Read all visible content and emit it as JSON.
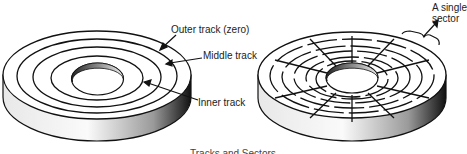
{
  "figure": {
    "caption": "Tracks and Sectors",
    "left_disk": {
      "title": "tracks-diagram",
      "labels": {
        "outer": "Outer track (zero)",
        "middle": "Middle track",
        "inner": "Inner track"
      },
      "track_count": 4
    },
    "right_disk": {
      "title": "sectors-diagram",
      "labels": {
        "sector_line1": "A single",
        "sector_line2": "sector"
      },
      "sector_count": 12,
      "track_rings": 5
    },
    "colors": {
      "line": "#111111",
      "background": "#ffffff",
      "shade_dark": "#1a1a1a",
      "shade_light": "#f2f2f2"
    }
  }
}
